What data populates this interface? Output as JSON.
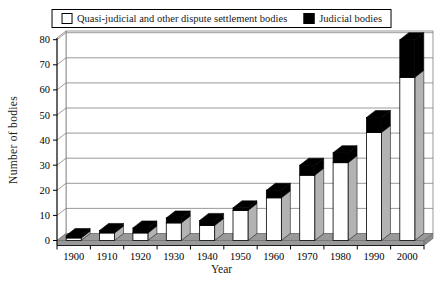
{
  "chart_data": {
    "type": "bar",
    "stacked": true,
    "style": "excel-3d",
    "title": "",
    "xlabel": "Year",
    "ylabel": "Number of bodies",
    "categories": [
      "1900",
      "1910",
      "1920",
      "1930",
      "1940",
      "1950",
      "1960",
      "1970",
      "1980",
      "1990",
      "2000"
    ],
    "series": [
      {
        "name": "Quasi-judicial and other dispute settlement bodies",
        "color": "#ffffff",
        "values": [
          1,
          3,
          3,
          7,
          6,
          12,
          17,
          26,
          31,
          43,
          65
        ]
      },
      {
        "name": "Judicial bodies",
        "color": "#000000",
        "values": [
          1,
          1,
          2,
          2,
          2,
          1,
          3,
          4,
          4,
          6,
          15
        ]
      }
    ],
    "totals": [
      2,
      4,
      5,
      9,
      8,
      13,
      20,
      30,
      35,
      49,
      80
    ],
    "ylim": [
      0,
      80
    ],
    "yticks": [
      0,
      10,
      20,
      30,
      40,
      50,
      60,
      70,
      80
    ],
    "grid": true,
    "legend_position": "top-center",
    "colors": {
      "floor": "#999999",
      "wall_line": "#808080",
      "bar_outline": "#000000",
      "white_bar_side_shade": "#b3b3b3",
      "axis": "#000000"
    }
  }
}
